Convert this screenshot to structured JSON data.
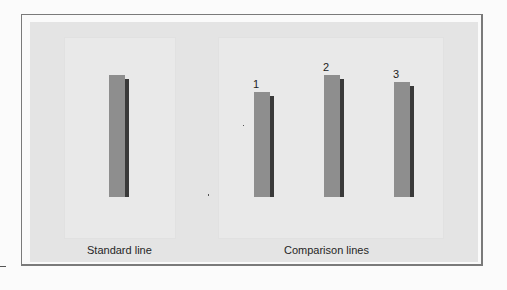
{
  "diagram": {
    "standard": {
      "caption": "Standard line",
      "bar": {
        "top": 75,
        "bottom": 197,
        "left": 109
      }
    },
    "comparison": {
      "caption": "Comparison lines",
      "bars": [
        {
          "label": "1",
          "top": 92,
          "bottom": 197,
          "left": 254
        },
        {
          "label": "2",
          "top": 75,
          "bottom": 197,
          "left": 324
        },
        {
          "label": "3",
          "top": 82,
          "bottom": 197,
          "left": 394
        }
      ]
    },
    "colors": {
      "bar": "#8e8e8e",
      "bar_shadow": "#3a3a3a",
      "background": "#e4e4e4",
      "panel": "#e9e9e9"
    }
  }
}
